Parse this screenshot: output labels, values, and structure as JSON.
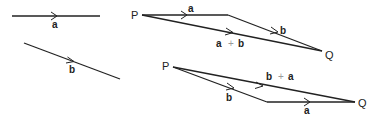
{
  "diagram": {
    "vector_a": {
      "label": "a"
    },
    "vector_b": {
      "label": "b"
    },
    "parallelogram_top": {
      "start_point": "P",
      "end_point": "Q",
      "first_side": "a",
      "second_side": "b",
      "resultant_left": "a",
      "resultant_plus": "+",
      "resultant_right": "b"
    },
    "parallelogram_bottom": {
      "start_point": "P",
      "end_point": "Q",
      "first_side": "b",
      "second_side": "a",
      "resultant_left": "b",
      "resultant_plus": "+",
      "resultant_right": "a"
    },
    "colors": {
      "line": "#222222",
      "plus": "#999999",
      "background": "#ffffff"
    }
  }
}
